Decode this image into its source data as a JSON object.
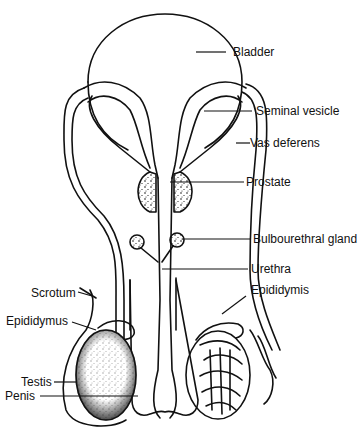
{
  "diagram": {
    "labels": {
      "bladder": "Bladder",
      "seminal_vesicle": "Seminal vesicle",
      "vas_deferens": "Vas deferens",
      "prostate": "Prostate",
      "bulbourethral_gland": "Bulbourethral gland",
      "urethra": "Urethra",
      "epididymis": "Epididymis",
      "scrotum": "Scrotum",
      "epididymus": "Epididymus",
      "testis": "Testis",
      "penis": "Penis"
    },
    "colors": {
      "line": "#111111",
      "background": "#ffffff"
    }
  }
}
